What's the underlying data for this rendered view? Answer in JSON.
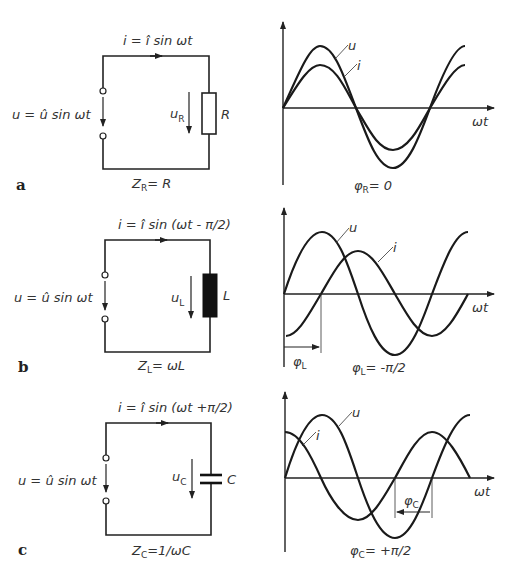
{
  "panels": [
    {
      "letter": "a",
      "component": "resistor",
      "current_eq": "i = î sin ωt",
      "source_eq": "u = û sin ωt",
      "voltage_label": "u",
      "voltage_sub": "R",
      "component_label": "R",
      "impedance": "Z",
      "impedance_sub": "R",
      "impedance_rhs": "= R",
      "phase": "φ",
      "phase_sub": "R",
      "phase_rhs": "= 0",
      "graph": {
        "u_label": "u",
        "i_label": "i",
        "x_label": "ωt"
      }
    },
    {
      "letter": "b",
      "component": "inductor",
      "current_eq": "i = î sin (ωt - π/2)",
      "source_eq": "u = û sin ωt",
      "voltage_label": "u",
      "voltage_sub": "L",
      "component_label": "L",
      "impedance": "Z",
      "impedance_sub": "L",
      "impedance_rhs": "= ωL",
      "phase": "φ",
      "phase_sub": "L",
      "phase_rhs": "= -π/2",
      "graph": {
        "u_label": "u",
        "i_label": "i",
        "x_label": "ωt",
        "shift_label": "φ",
        "shift_sub": "L"
      }
    },
    {
      "letter": "c",
      "component": "capacitor",
      "current_eq": "i = î sin (ωt +π/2)",
      "source_eq": "u = û sin ωt",
      "voltage_label": "u",
      "voltage_sub": "C",
      "component_label": "C",
      "impedance": "Z",
      "impedance_sub": "C",
      "impedance_rhs": "=1/ωC",
      "phase": "φ",
      "phase_sub": "C",
      "phase_rhs": "= +π/2",
      "graph": {
        "u_label": "u",
        "i_label": "i",
        "x_label": "ωt",
        "shift_label": "φ",
        "shift_sub": "C"
      }
    }
  ]
}
